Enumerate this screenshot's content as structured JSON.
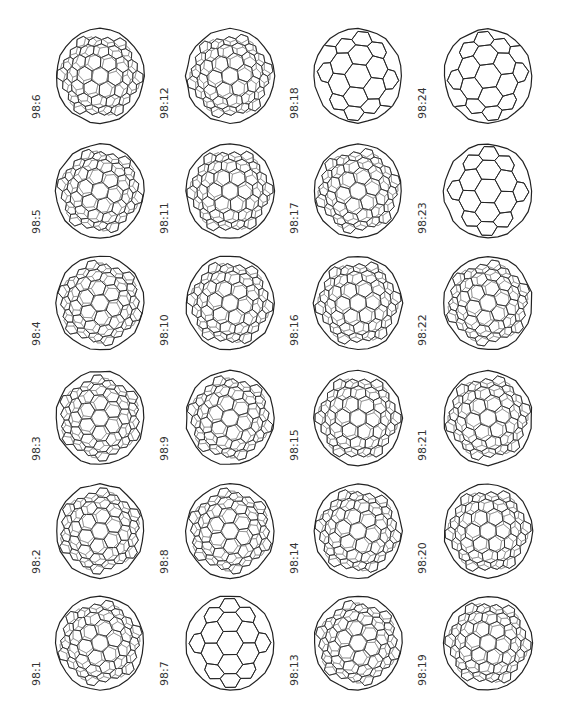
{
  "figure": {
    "layout": {
      "columns": 4,
      "rows": 6,
      "label_rotation": "-90deg"
    },
    "colors": {
      "stroke": "#222222",
      "background": "#ffffff",
      "label": "#333333"
    },
    "columns": [
      {
        "labels_bottom_to_top": [
          "98:1",
          "98:2",
          "98:3",
          "98:4",
          "98:5",
          "98:6"
        ]
      },
      {
        "labels_bottom_to_top": [
          "98:7",
          "98:8",
          "98:9",
          "98:10",
          "98:11",
          "98:12"
        ]
      },
      {
        "labels_bottom_to_top": [
          "98:13",
          "98:14",
          "98:15",
          "98:16",
          "98:17",
          "98:18"
        ]
      },
      {
        "labels_bottom_to_top": [
          "98:19",
          "98:20",
          "98:21",
          "98:22",
          "98:23",
          "98:24"
        ]
      }
    ]
  },
  "cells": [
    {
      "id": "98:6",
      "col": 0,
      "row": 0,
      "density": "high"
    },
    {
      "id": "98:12",
      "col": 1,
      "row": 0,
      "density": "high"
    },
    {
      "id": "98:18",
      "col": 2,
      "row": 0,
      "density": "low"
    },
    {
      "id": "98:24",
      "col": 3,
      "row": 0,
      "density": "low"
    },
    {
      "id": "98:5",
      "col": 0,
      "row": 1,
      "density": "high"
    },
    {
      "id": "98:11",
      "col": 1,
      "row": 1,
      "density": "high"
    },
    {
      "id": "98:17",
      "col": 2,
      "row": 1,
      "density": "high"
    },
    {
      "id": "98:23",
      "col": 3,
      "row": 1,
      "density": "low"
    },
    {
      "id": "98:4",
      "col": 0,
      "row": 2,
      "density": "high"
    },
    {
      "id": "98:10",
      "col": 1,
      "row": 2,
      "density": "high"
    },
    {
      "id": "98:16",
      "col": 2,
      "row": 2,
      "density": "high"
    },
    {
      "id": "98:22",
      "col": 3,
      "row": 2,
      "density": "high"
    },
    {
      "id": "98:3",
      "col": 0,
      "row": 3,
      "density": "high"
    },
    {
      "id": "98:9",
      "col": 1,
      "row": 3,
      "density": "high"
    },
    {
      "id": "98:15",
      "col": 2,
      "row": 3,
      "density": "high"
    },
    {
      "id": "98:21",
      "col": 3,
      "row": 3,
      "density": "high"
    },
    {
      "id": "98:2",
      "col": 0,
      "row": 4,
      "density": "high"
    },
    {
      "id": "98:8",
      "col": 1,
      "row": 4,
      "density": "high"
    },
    {
      "id": "98:14",
      "col": 2,
      "row": 4,
      "density": "high"
    },
    {
      "id": "98:20",
      "col": 3,
      "row": 4,
      "density": "high"
    },
    {
      "id": "98:1",
      "col": 0,
      "row": 5,
      "density": "high"
    },
    {
      "id": "98:7",
      "col": 1,
      "row": 5,
      "density": "low"
    },
    {
      "id": "98:13",
      "col": 2,
      "row": 5,
      "density": "high"
    },
    {
      "id": "98:19",
      "col": 3,
      "row": 5,
      "density": "high"
    }
  ]
}
